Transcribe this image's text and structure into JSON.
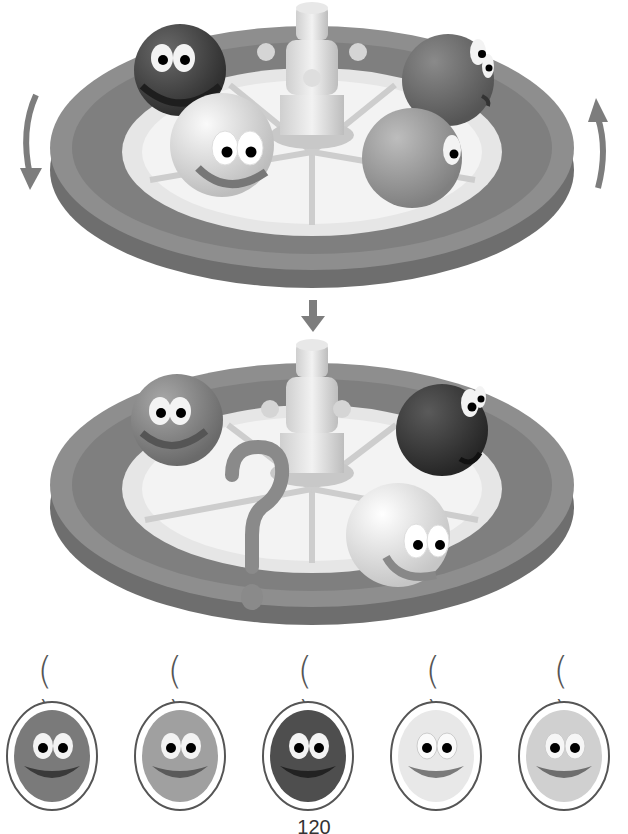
{
  "puzzle": {
    "top_turntable": {
      "rotation_arrows": [
        "counterclockwise-left-down",
        "clockwise-right-up"
      ],
      "balls": [
        {
          "position": "back-left",
          "shade": "#4a4a4a"
        },
        {
          "position": "back-right",
          "shade": "#6b6b6b"
        },
        {
          "position": "front-left",
          "shade": "#d8d8d8"
        },
        {
          "position": "front-right",
          "shade": "#9a9a9a"
        }
      ]
    },
    "transition_arrow": "down-arrow",
    "bottom_turntable": {
      "balls": [
        {
          "position": "back-left",
          "shade": "#8a8a8a"
        },
        {
          "position": "back-right",
          "shade": "#3f3f3f"
        },
        {
          "position": "front-right",
          "shade": "#e6e6e6"
        }
      ],
      "missing_marker": "?"
    },
    "choices": [
      {
        "label": "( )",
        "shade": "#7a7a7a"
      },
      {
        "label": "( )",
        "shade": "#a0a0a0"
      },
      {
        "label": "( )",
        "shade": "#4e4e4e"
      },
      {
        "label": "( )",
        "shade": "#e8e8e8"
      },
      {
        "label": "( )",
        "shade": "#d0d0d0"
      }
    ]
  },
  "page_number": "120",
  "colors": {
    "tray_rim": "#8c8c8c",
    "tray_side": "#7a7a7a",
    "tray_inner": "#eaeaea",
    "arrow": "#7d7d7d",
    "question_mark": "#8a8a8a"
  }
}
